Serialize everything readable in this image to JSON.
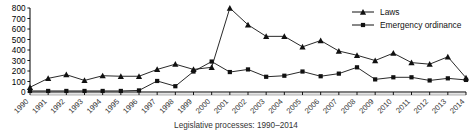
{
  "caption": "Legislative processes: 1990–2014",
  "legend": {
    "position": "top-right",
    "items": [
      {
        "label": "Laws",
        "marker": "triangle-marker-icon",
        "color": "#111111"
      },
      {
        "label": "Emergency ordinance",
        "marker": "square-marker-icon",
        "color": "#111111"
      }
    ]
  },
  "chart_data": {
    "type": "line",
    "title": "",
    "subtitle": "",
    "xlabel": "Legislative processes: 1990–2014",
    "ylabel": "",
    "grid": false,
    "legend_position": "top-right",
    "ylim": [
      0,
      800
    ],
    "ytick_labels": [
      "0",
      "100",
      "200",
      "300",
      "400",
      "500",
      "600",
      "700",
      "800"
    ],
    "yticks": [
      0,
      100,
      200,
      300,
      400,
      500,
      600,
      700,
      800
    ],
    "categories": [
      "1990",
      "1991",
      "1992",
      "1993",
      "1994",
      "1995",
      "1996",
      "1997",
      "1998",
      "1999",
      "2000",
      "2001",
      "2002",
      "2003",
      "2004",
      "2005",
      "2006",
      "2007",
      "2008",
      "2009",
      "2010",
      "2011",
      "2012",
      "2013",
      "2014"
    ],
    "x": [
      1990,
      1991,
      1992,
      1993,
      1994,
      1995,
      1996,
      1997,
      1998,
      1999,
      2000,
      2001,
      2002,
      2003,
      2004,
      2005,
      2006,
      2007,
      2008,
      2009,
      2010,
      2011,
      2012,
      2013,
      2014
    ],
    "series": [
      {
        "name": "Laws",
        "marker": "triangle",
        "values": [
          45,
          130,
          165,
          110,
          155,
          150,
          150,
          215,
          265,
          215,
          235,
          800,
          640,
          530,
          530,
          430,
          490,
          390,
          350,
          300,
          370,
          280,
          265,
          335,
          135
        ]
      },
      {
        "name": "Emergency ordinance",
        "marker": "square",
        "values": [
          10,
          10,
          10,
          10,
          10,
          10,
          15,
          105,
          55,
          195,
          290,
          190,
          215,
          145,
          155,
          195,
          150,
          175,
          235,
          120,
          140,
          140,
          110,
          130,
          115
        ]
      }
    ]
  }
}
